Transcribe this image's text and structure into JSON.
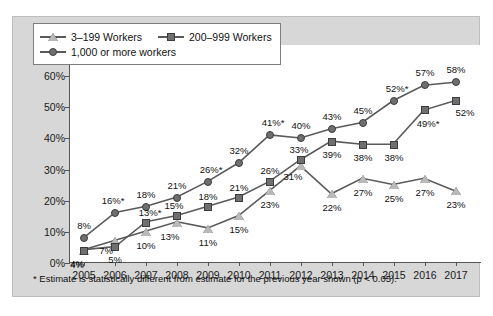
{
  "chart_data": {
    "type": "line",
    "title": "",
    "subtitle": "",
    "xlabel": "",
    "ylabel": "",
    "categories": [
      "2005",
      "2006",
      "2007",
      "2008",
      "2009",
      "2010",
      "2011",
      "2012",
      "2013",
      "2014",
      "2015",
      "2016",
      "2017"
    ],
    "ylim": [
      0,
      70
    ],
    "ytick_labels": [
      "0%",
      "10%",
      "20%",
      "30%",
      "40%",
      "50%",
      "60%",
      "70%"
    ],
    "ytick_values": [
      0,
      10,
      20,
      30,
      40,
      50,
      60,
      70
    ],
    "grid": false,
    "legend_position": "top-left",
    "series": [
      {
        "name": "3–199 Workers",
        "marker": "triangle",
        "color": "#b9b9b9",
        "line_color": "#5a5a5a",
        "values": [
          4,
          7,
          10,
          13,
          11,
          15,
          23,
          31,
          22,
          27,
          25,
          27,
          23
        ],
        "labels": [
          "4%",
          "7%",
          "10%",
          "13%",
          "11%",
          "15%",
          "23%",
          "31%",
          "22%",
          "27%",
          "25%",
          "27%",
          "23%"
        ]
      },
      {
        "name": "200–999 Workers",
        "marker": "square",
        "color": "#6f6f6f",
        "line_color": "#5a5a5a",
        "values": [
          4,
          5,
          13,
          15,
          18,
          21,
          26,
          33,
          39,
          38,
          38,
          49,
          52
        ],
        "labels": [
          "4%",
          "5%",
          "13%*",
          "15%",
          "18%",
          "21%",
          "26%",
          "33%",
          "39%",
          "38%",
          "38%",
          "49%*",
          "52%"
        ]
      },
      {
        "name": "1,000 or more workers",
        "marker": "circle",
        "color": "#6f6f6f",
        "line_color": "#5a5a5a",
        "values": [
          8,
          16,
          18,
          21,
          26,
          32,
          41,
          40,
          43,
          45,
          52,
          57,
          58
        ],
        "labels": [
          "8%",
          "16%*",
          "18%",
          "21%",
          "26%*",
          "32%",
          "41%*",
          "40%",
          "43%",
          "45%",
          "52%*",
          "57%",
          "58%"
        ]
      }
    ],
    "annotations": [
      "* Estimate is statistically different from estimate for the previous year shown (p < 0.05)."
    ]
  },
  "legend": {
    "items": [
      {
        "label": "3–199 Workers",
        "icon": "triangle-marker-icon"
      },
      {
        "label": "200–999 Workers",
        "icon": "square-marker-icon"
      },
      {
        "label": "1,000 or more workers",
        "icon": "circle-marker-icon"
      }
    ]
  },
  "footnote": {
    "text": "* Estimate is statistically different from estimate for the previous year shown (p < 0.05)."
  }
}
